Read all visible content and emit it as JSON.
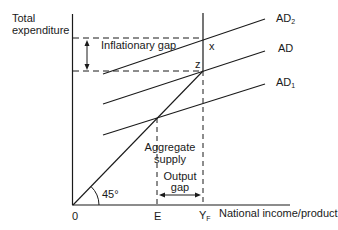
{
  "diagram": {
    "y_axis_label_line1": "Total",
    "y_axis_label_line2": "expenditure",
    "x_axis_label": "National income/product",
    "origin_label": "0",
    "angle_label": "45°",
    "tick_labels": {
      "E": "E",
      "YF_main": "Y",
      "YF_sub": "F"
    },
    "curves": {
      "AD2": {
        "main": "AD",
        "sub": "2"
      },
      "AD": {
        "main": "AD",
        "sub": ""
      },
      "AD1": {
        "main": "AD",
        "sub": "1"
      }
    },
    "aggregate_supply_line1": "Aggregate",
    "aggregate_supply_line2": "supply",
    "point_x": "x",
    "point_z": "z",
    "inflationary_gap_label": "Inflationary gap",
    "output_gap_line1": "Output",
    "output_gap_line2": "gap",
    "colors": {
      "line": "#1a1a1a",
      "background": "#ffffff"
    }
  }
}
